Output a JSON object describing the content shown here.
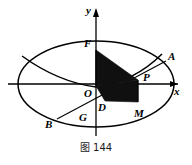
{
  "figure": {
    "caption": "图 144",
    "axes": {
      "x_label": "x",
      "y_label": "y"
    },
    "points": [
      {
        "id": "F",
        "label": "F",
        "x": 84,
        "y": 44
      },
      {
        "id": "A",
        "label": "A",
        "x": 168,
        "y": 57
      },
      {
        "id": "P",
        "label": "P",
        "x": 147,
        "y": 78
      },
      {
        "id": "O",
        "label": "O",
        "x": 85,
        "y": 94
      },
      {
        "id": "D",
        "label": "D",
        "x": 98,
        "y": 105
      },
      {
        "id": "G",
        "label": "G",
        "x": 79,
        "y": 113
      },
      {
        "id": "M",
        "label": "M",
        "x": 135,
        "y": 110
      },
      {
        "id": "B",
        "label": "B",
        "x": 46,
        "y": 122
      }
    ],
    "colors": {
      "stroke": "#000000",
      "shade_fill": "#101010",
      "background": "#ffffff",
      "caption_text": "#1a1a1a"
    },
    "geometry": {
      "ellipse": {
        "cx": 96,
        "cy": 84,
        "rx": 78,
        "ry": 43
      },
      "shaded_upper_triangle": "96,50 96,86 138,80",
      "shaded_lower_quad": "96,86 104,100 138,101 138,80",
      "chord_A_to_B": "165,62 58,118",
      "parabola": "22,56 60,76 96,86 126,76 160,56"
    }
  }
}
